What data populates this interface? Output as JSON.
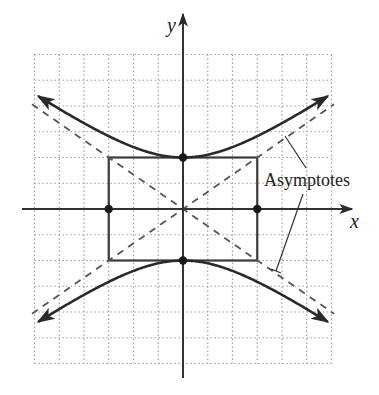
{
  "diagram": {
    "type": "hyperbola",
    "equation": "y^2/4 - x^2/9 = 1",
    "axis_labels": {
      "x": "x",
      "y": "y"
    },
    "annotation": "Asymptotes",
    "grid": {
      "xmin": -6,
      "xmax": 6,
      "ymin": -6,
      "ymax": 6,
      "step": 1,
      "style": "dotted"
    },
    "vertices": [
      [
        0,
        2
      ],
      [
        0,
        -2
      ]
    ],
    "co_vertices": [
      [
        -3,
        0
      ],
      [
        3,
        0
      ]
    ],
    "rectangle": {
      "x": [
        -3,
        3
      ],
      "y": [
        -2,
        2
      ]
    },
    "asymptotes": [
      "y = (2/3)x",
      "y = -(2/3)x"
    ],
    "colors": {
      "curve": "#2a2a2a",
      "grid": "#9a9a9a",
      "asymptote": "#555555",
      "axis": "#333333"
    }
  }
}
